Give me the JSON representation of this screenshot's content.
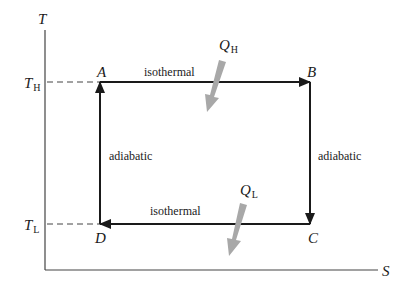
{
  "diagram": {
    "axes": {
      "y_label": "T",
      "x_label": "S"
    },
    "levels": {
      "high": {
        "symbol": "T",
        "subscript": "H"
      },
      "low": {
        "symbol": "T",
        "subscript": "L"
      }
    },
    "states": [
      "A",
      "B",
      "C",
      "D"
    ],
    "processes": {
      "top": "isothermal",
      "right": "adiabatic",
      "bottom": "isothermal",
      "left": "adiabatic"
    },
    "heat": {
      "in": {
        "symbol": "Q",
        "subscript": "H"
      },
      "out": {
        "symbol": "Q",
        "subscript": "L"
      }
    },
    "colors": {
      "line": "#1a1a1a",
      "axis": "#333333",
      "heat_arrow": "#a8a8a8"
    }
  }
}
